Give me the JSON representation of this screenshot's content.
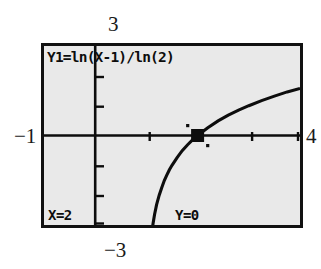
{
  "device": {
    "name": "graphing-calculator-screen",
    "screen_background": "#e9e9e9",
    "ink_color": "#0d0d0d",
    "page_background": "#ffffff"
  },
  "equation": {
    "label": "Y1=",
    "expression": "ln(X-1)/ln(2)",
    "full_text": "Y1=ln(X-1)/ln(2)"
  },
  "trace": {
    "x_label": "X=2",
    "y_label": "Y=0",
    "x_value": 2,
    "y_value": 0,
    "cursor_visible": true
  },
  "window": {
    "xmin_label": "−1",
    "xmax_label": "4",
    "ymin_label": "−3",
    "ymax_label": "3",
    "xmin": -1,
    "xmax": 4,
    "ymin": -3,
    "ymax": 3,
    "xscl": 1,
    "yscl": 1
  },
  "chart_data": {
    "type": "line",
    "title": "Y1=ln(X-1)/ln(2)",
    "xlabel": "",
    "ylabel": "",
    "xlim": [
      -1,
      4
    ],
    "ylim": [
      -3,
      3
    ],
    "grid": false,
    "legend": "none",
    "axis_ticks": {
      "x": [
        0,
        1,
        2,
        3,
        4
      ],
      "y": [
        -3,
        -2,
        -1,
        0,
        1,
        2,
        3
      ]
    },
    "annotations": [
      {
        "text": "Y1=ln(X-1)/ln(2)",
        "position": "top-left"
      },
      {
        "text": "X=2",
        "position": "bottom-left"
      },
      {
        "text": "Y=0",
        "position": "bottom-center"
      }
    ],
    "series": [
      {
        "name": "Y1 = log base 2 of (X-1)",
        "x": [
          1.06,
          1.08,
          1.1,
          1.13,
          1.16,
          1.2,
          1.25,
          1.3,
          1.35,
          1.4,
          1.45,
          1.5,
          1.6,
          1.7,
          1.8,
          1.9,
          2.0,
          2.2,
          2.4,
          2.6,
          2.8,
          3.0,
          3.25,
          3.5,
          3.75,
          4.0
        ],
        "y": [
          -4.06,
          -3.64,
          -3.32,
          -2.94,
          -2.64,
          -2.32,
          -2.0,
          -1.74,
          -1.51,
          -1.32,
          -1.15,
          -1.0,
          -0.74,
          -0.51,
          -0.32,
          -0.15,
          0.0,
          0.26,
          0.49,
          0.68,
          0.85,
          1.0,
          1.17,
          1.32,
          1.46,
          1.58
        ]
      }
    ],
    "marker": {
      "x": 2,
      "y": 0,
      "style": "trace-cursor"
    }
  }
}
